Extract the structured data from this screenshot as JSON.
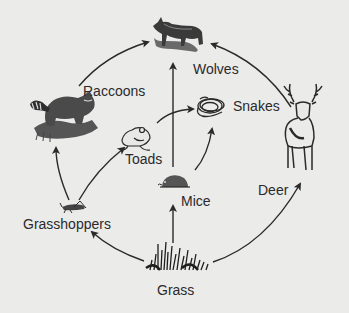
{
  "diagram": {
    "type": "food-web",
    "colors": {
      "background": "#ebebea",
      "ink": "#2a2a2a"
    },
    "organisms": [
      {
        "id": "wolves",
        "label": "Wolves",
        "icon": "wolf-icon"
      },
      {
        "id": "raccoons",
        "label": "Raccoons",
        "icon": "raccoon-icon"
      },
      {
        "id": "snakes",
        "label": "Snakes",
        "icon": "snake-icon"
      },
      {
        "id": "deer",
        "label": "Deer",
        "icon": "deer-icon"
      },
      {
        "id": "toads",
        "label": "Toads",
        "icon": "toad-icon"
      },
      {
        "id": "mice",
        "label": "Mice",
        "icon": "mouse-icon"
      },
      {
        "id": "grasshoppers",
        "label": "Grasshoppers",
        "icon": "grasshopper-icon"
      },
      {
        "id": "grass",
        "label": "Grass",
        "icon": "grass-icon"
      }
    ],
    "arrows": [
      {
        "from": "raccoons",
        "to": "wolves"
      },
      {
        "from": "deer",
        "to": "wolves"
      },
      {
        "from": "mice",
        "to": "wolves"
      },
      {
        "from": "toads",
        "to": "snakes"
      },
      {
        "from": "mice",
        "to": "snakes"
      },
      {
        "from": "grasshoppers",
        "to": "toads"
      },
      {
        "from": "grasshoppers",
        "to": "raccoons"
      },
      {
        "from": "grass",
        "to": "grasshoppers"
      },
      {
        "from": "grass",
        "to": "mice"
      },
      {
        "from": "grass",
        "to": "deer"
      }
    ]
  }
}
